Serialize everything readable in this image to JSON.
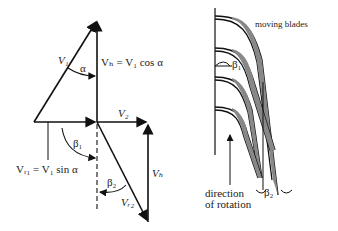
{
  "figure": {
    "velocity_triangle": {
      "labels": {
        "v1": "V₁",
        "alpha": "α",
        "vb_top": "Vₕ = V₁ cos α",
        "v2": "V₂",
        "beta1": "β₁",
        "vr1": "Vᵣ₁ = V₁ sin α",
        "beta2": "β₂",
        "vr2": "Vᵣ₂",
        "vb_right": "Vₕ"
      }
    },
    "blade_diagram": {
      "labels": {
        "moving_blades": "moving blades",
        "beta1": "β₁",
        "beta2": "β₂",
        "direction_line1": "direction",
        "direction_line2": "of rotation"
      }
    }
  }
}
